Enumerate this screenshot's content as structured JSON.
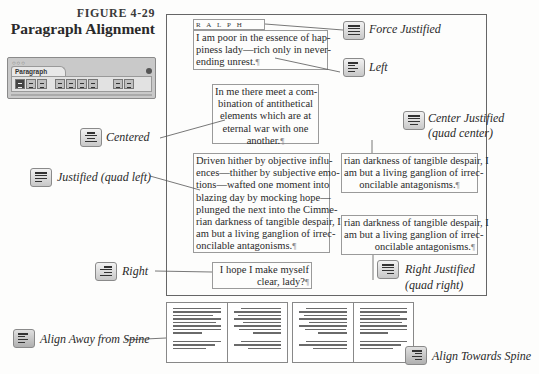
{
  "figure": {
    "number": "FIGURE 4-29",
    "title": "Paragraph Alignment"
  },
  "palette": {
    "title": "Paragraph",
    "window_dots": "○○○",
    "buttons": [
      "align-left",
      "align-center",
      "align-right",
      "justify-left",
      "justify-center",
      "justify-right",
      "justify-all",
      "align-towards-spine",
      "align-away-from-spine"
    ],
    "selected": "align-left"
  },
  "sample_heading": "RALPH",
  "samples": {
    "left": [
      "I am poor in the essence of hap-",
      "piness lady—rich only in never-",
      "ending unrest."
    ],
    "centered": [
      "In me there meet a com-",
      "bination of antithetical",
      "elements which are at",
      "eternal war with one",
      "another."
    ],
    "justified": [
      "Driven hither by objective influ-",
      "ences—thither by subjective emo-",
      "tions—wafted one moment into",
      "blazing day by mocking hope—",
      "plunged the next into the Cimme-",
      "rian darkness of tangible despair, I",
      "am but a living ganglion of irrec-",
      "oncilable antagonisms."
    ],
    "center_justified": [
      "rian darkness of tangible despair, I",
      "am but a living ganglion of irrec-",
      "oncilable antagonisms."
    ],
    "right_justified": [
      "rian darkness of tangible despair, I",
      "am but a living ganglion of irrec-",
      "oncilable antagonisms."
    ],
    "right": [
      "I hope I make myself",
      "clear, lady?"
    ]
  },
  "labels": {
    "force_justified": "Force Justified",
    "left": "Left",
    "centered": "Centered",
    "center_justified": "Center Justified",
    "center_justified_sub": "(quad center)",
    "justified": "Justified (quad left)",
    "right": "Right",
    "right_justified": "Right Justified",
    "right_justified_sub": "(quad right)",
    "align_away": "Align Away from Spine",
    "align_towards": "Align Towards Spine"
  },
  "pilcrow": "¶"
}
